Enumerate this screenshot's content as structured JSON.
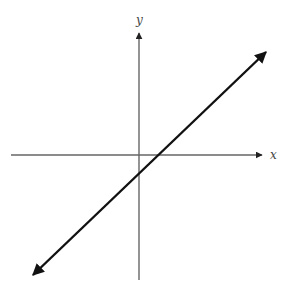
{
  "figure": {
    "x_axis": {
      "label": "x",
      "color": "#666666",
      "from": [
        11,
        155
      ],
      "to": [
        262,
        155
      ]
    },
    "y_axis": {
      "label": "y",
      "color": "#666666",
      "from": [
        139,
        280
      ],
      "to": [
        139,
        33
      ]
    },
    "line": {
      "color": "#111111",
      "from": [
        33,
        275
      ],
      "to": [
        266,
        52
      ],
      "slope_sign": "positive",
      "y_intercept_sign": "negative",
      "x_intercept_sign": "positive",
      "arrows": "both ends"
    },
    "labels": {
      "x": {
        "text": "x",
        "pos": [
          270,
          159
        ]
      },
      "y": {
        "text": "y",
        "pos": [
          136,
          24
        ]
      }
    }
  }
}
